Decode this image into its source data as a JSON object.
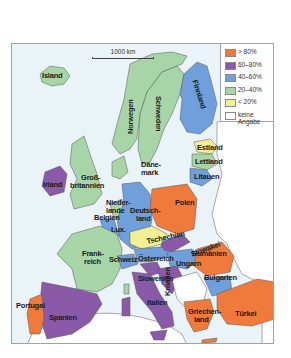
{
  "map": {
    "scale_label": "1000 km",
    "colors": {
      "gt80": "#f07a3c",
      "p60_80": "#8a5aa8",
      "p40_60": "#6fa0dc",
      "p20_40": "#a8d5a8",
      "lt20": "#f3ef95",
      "none": "#ffffff",
      "sea": "#eaf3f8"
    },
    "legend": [
      {
        "key": "gt80",
        "label": "> 80%",
        "color": "#f07a3c"
      },
      {
        "key": "p60_80",
        "label": "60–80%",
        "color": "#8a5aa8"
      },
      {
        "key": "p40_60",
        "label": "40–60%",
        "color": "#6fa0dc"
      },
      {
        "key": "p20_40",
        "label": "20–40%",
        "color": "#a8d5a8"
      },
      {
        "key": "lt20",
        "label": "< 20%",
        "color": "#f3ef95"
      },
      {
        "key": "none",
        "label": "keine Angabe",
        "label_line1": "keine",
        "label_line2": "Angabe",
        "color": "#ffffff"
      }
    ],
    "countries": {
      "island": {
        "label": "Island",
        "category": "20–40%"
      },
      "norwegen": {
        "label": "Norwegen",
        "category": "20–40%"
      },
      "schweden": {
        "label": "Schweden",
        "category": "20–40%"
      },
      "finnland": {
        "label": "Finnland",
        "category": "40–60%"
      },
      "estland": {
        "label": "Estland",
        "category": "< 20%"
      },
      "lettland": {
        "label": "Lettland",
        "category": "20–40%"
      },
      "litauen": {
        "label": "Litauen",
        "category": "40–60%"
      },
      "daenemark": {
        "label": "Däne-",
        "label2": "mark",
        "category": "20–40%"
      },
      "irland": {
        "label": "Irland",
        "category": "60–80%"
      },
      "grossbritannien": {
        "label": "Groß-",
        "label2": "britannien",
        "category": "20–40%"
      },
      "niederlande": {
        "label": "Nieder-",
        "label2": "lande",
        "category": "20–40%"
      },
      "belgien": {
        "label": "Belgien",
        "category": "40–60%"
      },
      "lux": {
        "label": "Lux.",
        "category": "40–60%"
      },
      "deutschland": {
        "label": "Deutsch-",
        "label2": "land",
        "category": "40–60%"
      },
      "polen": {
        "label": "Polen",
        "category": "> 80%"
      },
      "tschechien": {
        "label": "Tschechien",
        "category": "< 20%"
      },
      "slowakei": {
        "label": "Slowakei",
        "category": "60–80%"
      },
      "frankreich": {
        "label": "Frank-",
        "label2": "reich",
        "category": "20–40%"
      },
      "schweiz": {
        "label": "Schweiz",
        "category": "40–60%"
      },
      "oesterreich": {
        "label": "Österreich",
        "category": "40–60%"
      },
      "ungarn": {
        "label": "Ungarn",
        "category": "40–60%"
      },
      "slowenien": {
        "label": "Slowenien",
        "category": "60–80%"
      },
      "kroatien": {
        "label": "Kroatien",
        "category": "60–80%"
      },
      "rumaenien": {
        "label": "Rumänien",
        "category": "> 80%"
      },
      "bulgarien": {
        "label": "Bulgarien",
        "category": "40–60%"
      },
      "portugal": {
        "label": "Portugal",
        "category": "> 80%"
      },
      "spanien": {
        "label": "Spanien",
        "category": "60–80%"
      },
      "italien": {
        "label": "Italien",
        "category": "60–80%"
      },
      "griechenland": {
        "label": "Griechen-",
        "label2": "land",
        "category": "> 80%"
      },
      "tuerkei": {
        "label": "Türkei",
        "category": "> 80%"
      }
    }
  }
}
